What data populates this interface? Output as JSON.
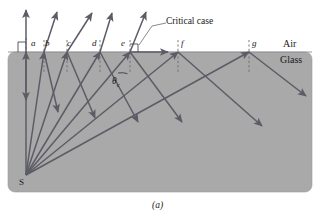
{
  "figure": {
    "caption": "(a)",
    "source_label": "S",
    "annotation": "Critical case",
    "angle_label": "θ",
    "angle_subscript": "c",
    "media": {
      "upper": "Air",
      "lower": "Glass"
    },
    "interface_points": [
      {
        "id": "a",
        "label": "a",
        "x": 34,
        "y": 45
      },
      {
        "id": "b",
        "label": "b",
        "x": 48,
        "y": 45
      },
      {
        "id": "c",
        "label": "c",
        "x": 70,
        "y": 45
      },
      {
        "id": "d",
        "label": "d",
        "x": 95,
        "y": 45
      },
      {
        "id": "e",
        "label": "e",
        "x": 124,
        "y": 45
      },
      {
        "id": "f",
        "label": "f",
        "x": 182,
        "y": 45
      },
      {
        "id": "g",
        "label": "g",
        "x": 253,
        "y": 45
      }
    ],
    "colors": {
      "glass": "#a9a9a9",
      "air": "#ffffff",
      "ray": "#5c5c66",
      "text": "#1a1a1a",
      "normal_dash": "#6b6b74"
    },
    "geometry": {
      "source": {
        "x": 26,
        "y": 175
      },
      "interface_y": 52,
      "block": {
        "x": 8,
        "y": 52,
        "width": 304,
        "height": 140
      },
      "hits": [
        {
          "id": "a",
          "x": 26
        },
        {
          "id": "b",
          "x": 44
        },
        {
          "id": "c",
          "x": 67
        },
        {
          "id": "d",
          "x": 100
        },
        {
          "id": "e",
          "x": 130
        },
        {
          "id": "f",
          "x": 178
        },
        {
          "id": "g",
          "x": 249
        }
      ],
      "refracted": [
        {
          "id": "a",
          "x2": 26,
          "y2": 10
        },
        {
          "id": "b",
          "x2": 57,
          "y2": 12
        },
        {
          "id": "c",
          "x2": 92,
          "y2": 13
        },
        {
          "id": "d",
          "x2": 112,
          "y2": 13
        },
        {
          "id": "e",
          "x2": 146,
          "y2": 12
        },
        {
          "id": "critical",
          "x2": 168,
          "y2": 52
        }
      ],
      "reflected": [
        {
          "id": "a",
          "x2": 26,
          "y2": 100
        },
        {
          "id": "b",
          "x2": 58,
          "y2": 112
        },
        {
          "id": "c",
          "x2": 95,
          "y2": 118
        },
        {
          "id": "d",
          "x2": 138,
          "y2": 122
        },
        {
          "id": "e",
          "x2": 182,
          "y2": 122
        },
        {
          "id": "f",
          "x2": 262,
          "y2": 126
        },
        {
          "id": "g",
          "x2": 306,
          "y2": 96
        }
      ]
    }
  }
}
